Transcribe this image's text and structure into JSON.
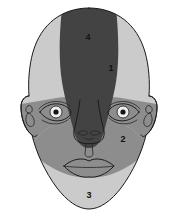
{
  "figure": {
    "background_color": "#ffffff",
    "width": 179,
    "height": 224
  },
  "palette": {
    "region_light": "#cbcbcb",
    "region_medium": "#8d8d8d",
    "region_dark": "#434343",
    "outline": "#1b1b1b",
    "label_text": "#111111",
    "eye_white": "#e8e8e8",
    "pupil": "#141414"
  },
  "regions": [
    {
      "id": "region-1",
      "label": "1",
      "shade": "light",
      "color": "#cbcbcb",
      "label_x": 111,
      "label_y": 69
    },
    {
      "id": "region-2",
      "label": "2",
      "shade": "medium",
      "color": "#8d8d8d",
      "label_x": 123,
      "label_y": 140
    },
    {
      "id": "region-3",
      "label": "3",
      "shade": "light",
      "color": "#cbcbcb",
      "label_x": 89,
      "label_y": 196
    },
    {
      "id": "region-4",
      "label": "4",
      "shade": "dark",
      "color": "#434343",
      "label_x": 88,
      "label_y": 38
    }
  ],
  "anatomy": {
    "head_outline": "head-outline",
    "left_ear": "left-ear",
    "right_ear": "right-ear",
    "left_eye": "left-eye",
    "right_eye": "right-eye",
    "nose": "nose",
    "mouth": "mouth"
  }
}
